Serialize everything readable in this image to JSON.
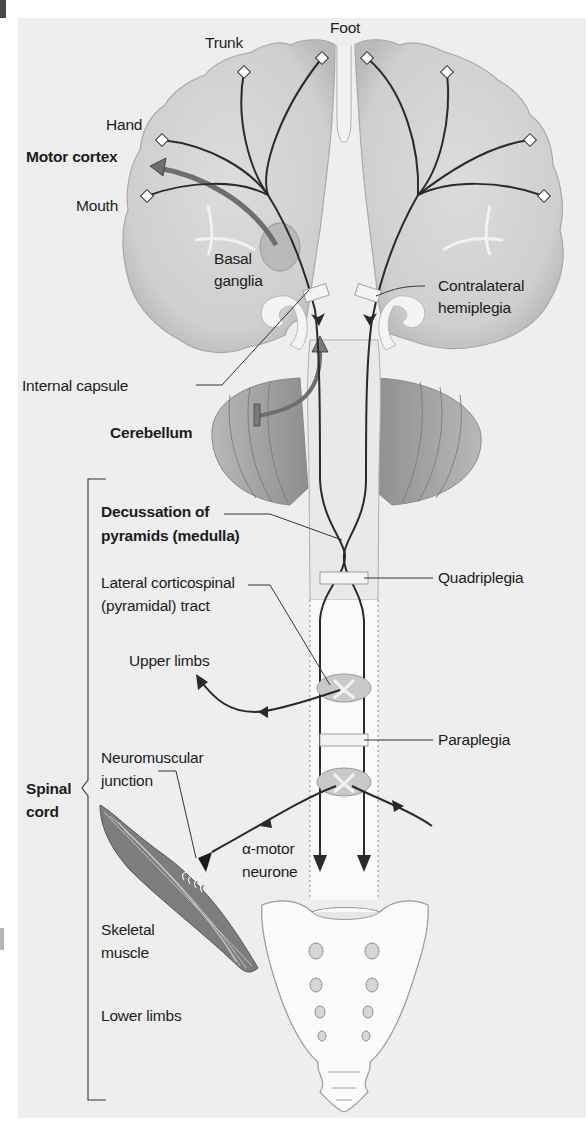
{
  "figure": {
    "colors": {
      "background": "#eeeeee",
      "brain_fill": "#d2d2d2",
      "brain_edge": "#a8a8a8",
      "cerebellum_fill": "#9c9c9c",
      "tract_line": "#2a2a2a",
      "lesion_box": "#f4f4f4",
      "spinal_channel": "#fafafa",
      "bone_fill": "#fbfbfb",
      "muscle_fill": "#7d7d7d",
      "basal_arrow": "#707070"
    }
  },
  "labels": {
    "trunk": "Trunk",
    "foot": "Foot",
    "hand": "Hand",
    "motor_cortex": "Motor cortex",
    "mouth": "Mouth",
    "basal_ganglia": "Basal\nganglia",
    "contralateral_hemiplegia": "Contralateral\nhemiplegia",
    "internal_capsule": "Internal capsule",
    "cerebellum": "Cerebellum",
    "decussation": "Decussation of\npyramids (medulla)",
    "lateral_tract": "Lateral corticospinal\n(pyramidal) tract",
    "quadriplegia": "Quadriplegia",
    "upper_limbs": "Upper limbs",
    "paraplegia": "Paraplegia",
    "neuromuscular_junction": "Neuromuscular\njunction",
    "spinal_cord": "Spinal\ncord",
    "alpha_motor_neurone": "α-motor\nneurone",
    "skeletal_muscle": "Skeletal\nmuscle",
    "lower_limbs": "Lower limbs"
  }
}
